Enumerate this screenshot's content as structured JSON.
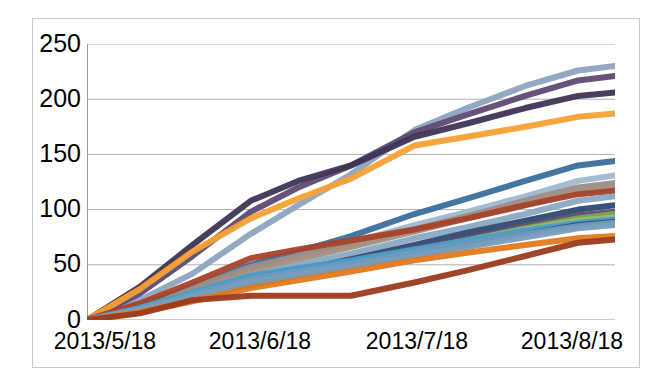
{
  "chart_data": {
    "type": "line",
    "title": "",
    "subtitle": "",
    "xlabel": "",
    "ylabel": "",
    "x_tick_labels": [
      "2013/5/18",
      "2013/6/18",
      "2013/7/18",
      "2013/8/18"
    ],
    "x_tick_positions": [
      0,
      31,
      62,
      93
    ],
    "y_tick_labels": [
      "0",
      "50",
      "100",
      "150",
      "200",
      "250"
    ],
    "y_ticks": [
      0,
      50,
      100,
      150,
      200,
      250
    ],
    "ylim": [
      0,
      250
    ],
    "xlim": [
      0,
      100
    ],
    "grid": "horizontal",
    "legend": "none",
    "marker": "none",
    "line_width_px": 6,
    "x": [
      0,
      10,
      20,
      31,
      40,
      50,
      62,
      72,
      83,
      93,
      100
    ],
    "series": [
      {
        "name": "series-01",
        "color": "#8da4c0",
        "values": [
          0,
          18,
          42,
          78,
          104,
          132,
          172,
          192,
          212,
          226,
          230
        ]
      },
      {
        "name": "series-02",
        "color": "#5f4a72",
        "values": [
          0,
          24,
          58,
          98,
          120,
          140,
          170,
          186,
          203,
          217,
          221
        ]
      },
      {
        "name": "series-03",
        "color": "#3f3454",
        "values": [
          0,
          30,
          68,
          108,
          126,
          140,
          166,
          178,
          192,
          203,
          206
        ]
      },
      {
        "name": "series-04",
        "color": "#f5a133",
        "values": [
          0,
          28,
          62,
          92,
          110,
          128,
          158,
          166,
          175,
          184,
          187
        ]
      },
      {
        "name": "series-05",
        "color": "#3b6e9c",
        "values": [
          0,
          14,
          30,
          50,
          62,
          76,
          96,
          110,
          126,
          140,
          144
        ]
      },
      {
        "name": "series-06",
        "color": "#9fb8cf",
        "values": [
          0,
          12,
          27,
          46,
          58,
          70,
          86,
          98,
          112,
          126,
          131
        ]
      },
      {
        "name": "series-07",
        "color": "#9c8b86",
        "values": [
          0,
          13,
          29,
          48,
          58,
          68,
          82,
          94,
          108,
          120,
          124
        ]
      },
      {
        "name": "series-08",
        "color": "#a4917e",
        "values": [
          0,
          11,
          26,
          44,
          55,
          66,
          80,
          92,
          104,
          116,
          120
        ]
      },
      {
        "name": "series-09",
        "color": "#a8422a",
        "values": [
          0,
          15,
          34,
          56,
          64,
          72,
          82,
          92,
          104,
          114,
          117
        ]
      },
      {
        "name": "series-10",
        "color": "#8aa9c4",
        "values": [
          0,
          10,
          24,
          40,
          50,
          60,
          74,
          84,
          96,
          108,
          112
        ]
      },
      {
        "name": "series-11",
        "color": "#2d4a6e",
        "values": [
          0,
          9,
          21,
          36,
          45,
          55,
          68,
          79,
          90,
          100,
          104
        ]
      },
      {
        "name": "series-12",
        "color": "#5b4a78",
        "values": [
          0,
          10,
          23,
          38,
          46,
          54,
          65,
          74,
          85,
          95,
          98
        ]
      },
      {
        "name": "series-13",
        "color": "#7cab45",
        "values": [
          0,
          8,
          20,
          34,
          42,
          50,
          62,
          72,
          83,
          92,
          96
        ]
      },
      {
        "name": "series-14",
        "color": "#9ab87a",
        "values": [
          0,
          9,
          22,
          36,
          44,
          52,
          63,
          72,
          82,
          90,
          93
        ]
      },
      {
        "name": "series-15",
        "color": "#4a9cc9",
        "values": [
          0,
          11,
          25,
          40,
          47,
          54,
          64,
          72,
          81,
          88,
          91
        ]
      },
      {
        "name": "series-16",
        "color": "#35506f",
        "values": [
          0,
          8,
          19,
          32,
          40,
          48,
          59,
          68,
          78,
          86,
          89
        ]
      },
      {
        "name": "series-17",
        "color": "#6f9bbd",
        "values": [
          0,
          10,
          23,
          37,
          44,
          51,
          61,
          69,
          78,
          85,
          88
        ]
      },
      {
        "name": "series-18",
        "color": "#7a9ebd",
        "values": [
          0,
          9,
          21,
          34,
          41,
          48,
          58,
          66,
          75,
          83,
          86
        ]
      },
      {
        "name": "series-19",
        "color": "#e07a1f",
        "values": [
          0,
          7,
          17,
          29,
          36,
          44,
          54,
          61,
          68,
          74,
          76
        ]
      },
      {
        "name": "series-20",
        "color": "#9c3b1c",
        "values": [
          0,
          6,
          18,
          22,
          22,
          22,
          34,
          45,
          58,
          70,
          73
        ]
      }
    ]
  },
  "axes": {
    "y_axis": {
      "ticks": [
        {
          "label": "250",
          "value": 250
        },
        {
          "label": "200",
          "value": 200
        },
        {
          "label": "150",
          "value": 150
        },
        {
          "label": "100",
          "value": 100
        },
        {
          "label": "50",
          "value": 50
        },
        {
          "label": "0",
          "value": 0
        }
      ]
    },
    "x_axis": {
      "ticks": [
        {
          "label": "2013/5/18",
          "value": 0
        },
        {
          "label": "2013/6/18",
          "value": 31
        },
        {
          "label": "2013/7/18",
          "value": 62
        },
        {
          "label": "2013/8/18",
          "value": 93
        }
      ]
    }
  },
  "style": {
    "gridline_color": "#b0b0b0",
    "axis_color": "#9a9a9a",
    "frame_color": "#c9c9c9",
    "background": "#ffffff",
    "text_color": "#000000"
  }
}
